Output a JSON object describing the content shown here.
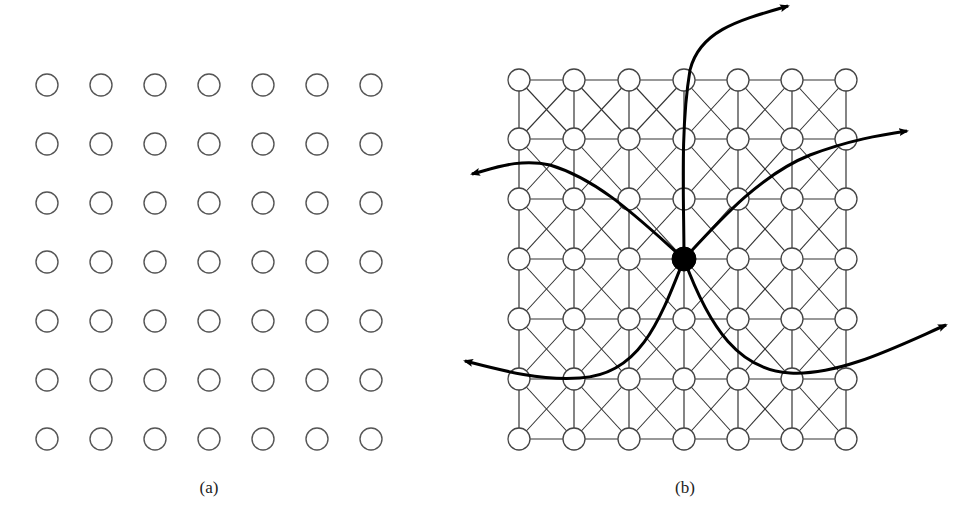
{
  "figure": {
    "panel_a": {
      "label": "(a)",
      "rows": 7,
      "cols": 7,
      "node_radius": 11,
      "col_x": [
        47,
        101,
        155,
        209,
        263,
        317,
        371
      ],
      "row_y": [
        85,
        144,
        203,
        262,
        321,
        380,
        439
      ],
      "node_stroke": "#555555",
      "label_pos": [
        209,
        490
      ]
    },
    "panel_b": {
      "label": "(b)",
      "rows": 7,
      "cols": 7,
      "node_radius": 11,
      "col_x": [
        519,
        574,
        629,
        684,
        738,
        792,
        846
      ],
      "row_y": [
        80,
        139,
        199,
        259,
        319,
        379,
        439
      ],
      "node_stroke": "#444444",
      "edge_color": "#333333",
      "edges": [
        "horizontal",
        "vertical",
        "diagonal-cross"
      ],
      "center_node": {
        "row": 3,
        "col": 3,
        "color": "#000000",
        "radius": 12
      },
      "paths": [
        {
          "name": "path-up",
          "d": "M684 259 C 684 200, 680 130, 690 70 C 700 30, 740 20, 788 6"
        },
        {
          "name": "path-upper-right",
          "d": "M684 259 C 720 220, 760 175, 810 155 C 850 140, 880 135, 907 131"
        },
        {
          "name": "path-upper-left",
          "d": "M684 259 C 640 220, 600 180, 550 165 C 520 158, 495 168, 472 174"
        },
        {
          "name": "path-lower-left",
          "d": "M684 259 C 660 320, 640 375, 580 378 C 540 381, 500 370, 465 361"
        },
        {
          "name": "path-lower-right",
          "d": "M684 259 C 710 330, 740 370, 790 373 C 840 376, 900 345, 946 325"
        }
      ],
      "label_pos": [
        685,
        490
      ]
    }
  }
}
